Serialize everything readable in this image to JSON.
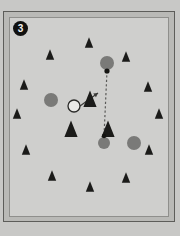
{
  "figure": {
    "panel_label": "3",
    "background_color": "#c8c8c6",
    "panel_color": "#cfcfcd",
    "frame_color": "#5d5d5a",
    "width": 180,
    "height": 236
  },
  "scene": {
    "title": "visual search array panel 3",
    "colors": {
      "distractor_triangle": "#1b1b19",
      "gray_circle": "#7a7a78",
      "target_circle_fill": "#e8e8e6",
      "target_circle_stroke": "#2a2a28",
      "arrow": "#3a3a38",
      "dashed_path": "#5a5a58",
      "dot": "#141412"
    },
    "small_triangles": [
      {
        "name": "triangle-1",
        "x": 79,
        "y": 26,
        "size": 7
      },
      {
        "name": "triangle-2",
        "x": 40,
        "y": 38,
        "size": 7
      },
      {
        "name": "triangle-3",
        "x": 116,
        "y": 40,
        "size": 7
      },
      {
        "name": "triangle-4",
        "x": 14,
        "y": 68,
        "size": 7
      },
      {
        "name": "triangle-5",
        "x": 138,
        "y": 70,
        "size": 7
      },
      {
        "name": "triangle-6",
        "x": 7,
        "y": 97,
        "size": 7
      },
      {
        "name": "triangle-7",
        "x": 149,
        "y": 97,
        "size": 7
      },
      {
        "name": "triangle-8",
        "x": 16,
        "y": 133,
        "size": 7
      },
      {
        "name": "triangle-9",
        "x": 139,
        "y": 133,
        "size": 7
      },
      {
        "name": "triangle-10",
        "x": 42,
        "y": 159,
        "size": 7
      },
      {
        "name": "triangle-11",
        "x": 80,
        "y": 170,
        "size": 7
      },
      {
        "name": "triangle-12",
        "x": 116,
        "y": 161,
        "size": 7
      }
    ],
    "large_triangles": [
      {
        "name": "triangle-large-center",
        "x": 80,
        "y": 83,
        "size": 11
      },
      {
        "name": "triangle-large-left",
        "x": 61,
        "y": 113,
        "size": 11
      },
      {
        "name": "triangle-large-right",
        "x": 98,
        "y": 113,
        "size": 11
      }
    ],
    "gray_circles": [
      {
        "name": "gray-circle-top",
        "x": 97,
        "y": 45,
        "r": 7
      },
      {
        "name": "gray-circle-left",
        "x": 41,
        "y": 82,
        "r": 7
      },
      {
        "name": "gray-circle-lower",
        "x": 94,
        "y": 125,
        "r": 6
      },
      {
        "name": "gray-circle-right",
        "x": 124,
        "y": 125,
        "r": 7
      }
    ],
    "target_circle": {
      "name": "target-open-circle",
      "x": 64,
      "y": 88,
      "r": 6
    },
    "arrow": {
      "name": "gaze-arrow",
      "x1": 70,
      "y1": 88,
      "x2": 88,
      "y2": 75
    },
    "dashed_path": {
      "name": "saccade-path",
      "points": [
        [
          97,
          53
        ],
        [
          94,
          118
        ]
      ],
      "dot_start": {
        "x": 97,
        "y": 53,
        "r": 2.6
      },
      "dot_end": {
        "x": 94,
        "y": 118,
        "r": 2.2
      }
    }
  }
}
